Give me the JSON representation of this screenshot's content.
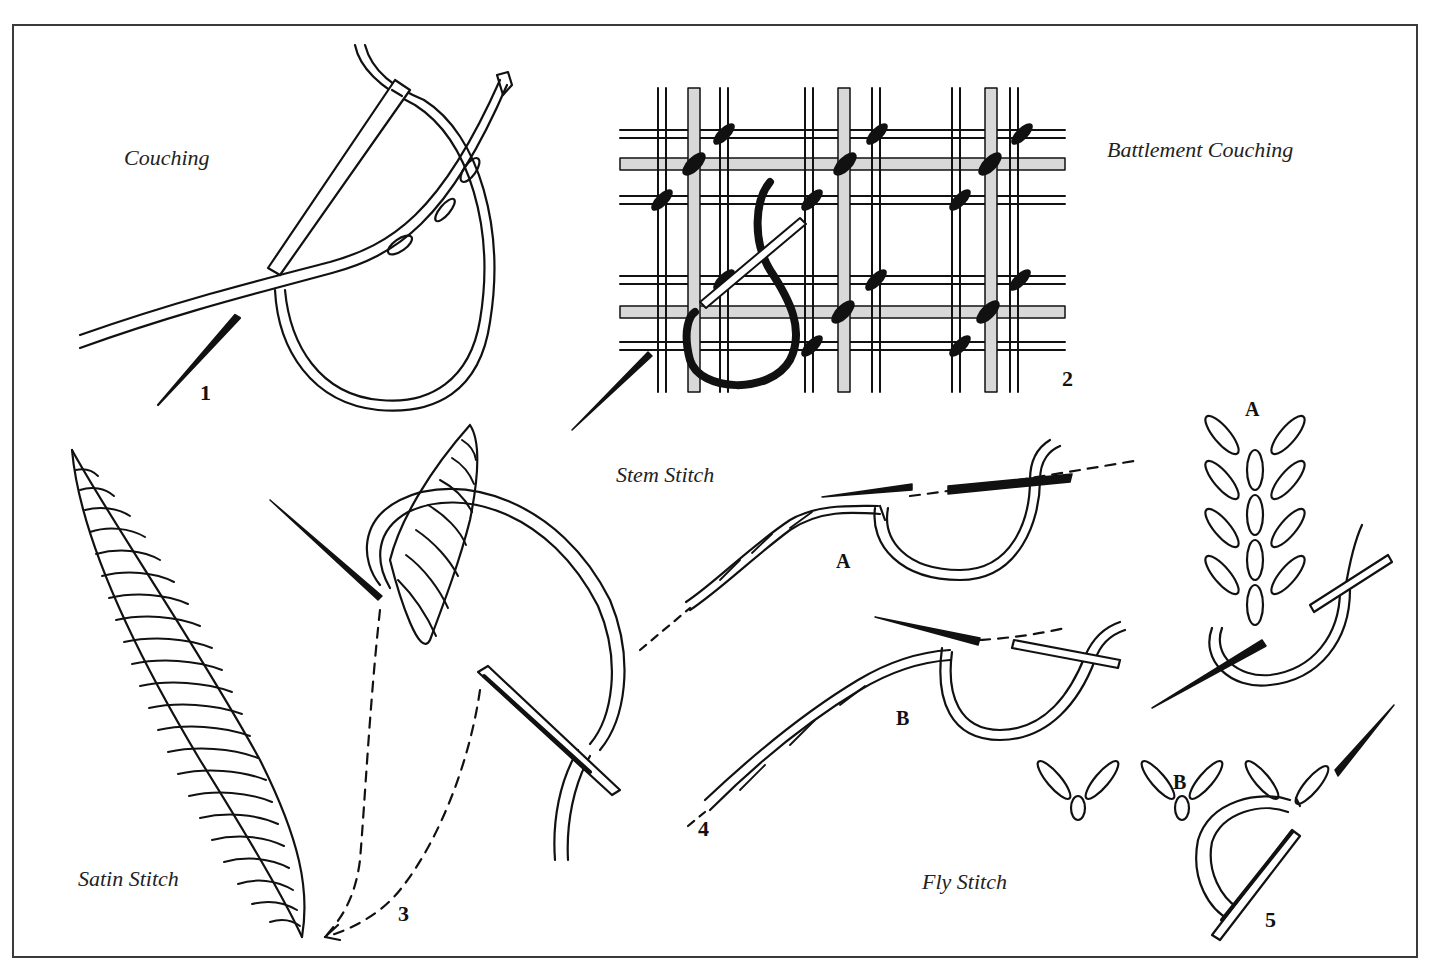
{
  "page": {
    "colors": {
      "background": "#ffffff",
      "ink": "#111111",
      "frame": "#3a3a3a",
      "label": "#222222"
    }
  },
  "figures": [
    {
      "id": 1,
      "number": "1",
      "label": "Couching"
    },
    {
      "id": 2,
      "number": "2",
      "label": "Battlement Couching"
    },
    {
      "id": 3,
      "number": "3",
      "label": "Satin Stitch"
    },
    {
      "id": 4,
      "number": "4",
      "label": "Stem Stitch",
      "steps": [
        "A",
        "B"
      ]
    },
    {
      "id": 5,
      "number": "5",
      "label": "Fly Stitch",
      "steps": [
        "A",
        "B"
      ]
    }
  ]
}
